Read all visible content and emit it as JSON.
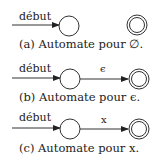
{
  "start_label": "début",
  "diagrams": [
    {
      "id": "a",
      "caption": "(a) Automate pour ∅.",
      "transition_label": ""
    },
    {
      "id": "b",
      "caption": "(b) Automate pour ϵ.",
      "transition_label": "ϵ"
    },
    {
      "id": "c",
      "caption": "(c) Automate pour x.",
      "transition_label": "x"
    }
  ],
  "colors": {
    "stroke": "#333333",
    "text": "#222222",
    "background": "#ffffff"
  }
}
